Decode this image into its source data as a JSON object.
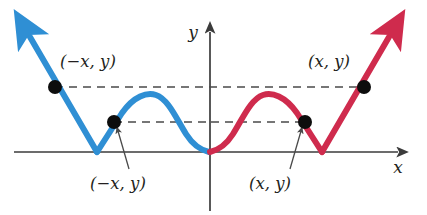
{
  "figure": {
    "background_color": "#ffffff",
    "width": 427,
    "height": 215
  },
  "axes": {
    "x_label": "x",
    "y_label": "y",
    "axis_color": "#3b3b3b",
    "origin": {
      "x": 210,
      "y": 152
    },
    "x_axis": {
      "x_start": 14,
      "x_end": 404,
      "y": 152
    },
    "y_axis": {
      "x": 210,
      "y_top": 26,
      "y_bottom": 211
    }
  },
  "curves": [
    {
      "name": "left-branch",
      "color": "#2f8fd4",
      "description": "reflected W-shaped piecewise curve left of the y-axis with arrow at upper-left"
    },
    {
      "name": "right-branch",
      "color": "#cf2b4d",
      "description": "W-shaped piecewise curve right of the y-axis with arrow at upper-right"
    }
  ],
  "points": [
    {
      "id": "upper-left",
      "label": "(−x, y)",
      "cx": 55,
      "cy": 87,
      "label_x": 62,
      "label_y": 63
    },
    {
      "id": "upper-right",
      "label": "(x, y)",
      "cx": 364,
      "cy": 87,
      "label_x": 305,
      "label_y": 63
    },
    {
      "id": "lower-left",
      "label": "(−x, y)",
      "cx": 114,
      "cy": 122,
      "label_x": 88,
      "label_y": 184
    },
    {
      "id": "lower-right",
      "label": "(x, y)",
      "cx": 305,
      "cy": 122,
      "label_x": 247,
      "label_y": 184
    }
  ],
  "dashed_lines": [
    {
      "id": "upper-dashed",
      "x1": 55,
      "x2": 364,
      "y": 87
    },
    {
      "id": "lower-dashed-left",
      "x1": 114,
      "x2": 210,
      "y": 122
    },
    {
      "id": "lower-dashed-right",
      "x1": 210,
      "x2": 305,
      "y": 122
    }
  ],
  "leader_lines": [
    {
      "id": "leader-left",
      "from_x": 128,
      "from_y": 170,
      "to_x": 118,
      "to_y": 130
    },
    {
      "id": "leader-right",
      "from_x": 291,
      "from_y": 170,
      "to_x": 301,
      "to_y": 130
    }
  ],
  "labels": {
    "upper_left": "(−x, y)",
    "upper_right": "(x, y)",
    "lower_left": "(−x, y)",
    "lower_right": "(x, y)",
    "x_axis": "x",
    "y_axis": "y"
  },
  "colors": {
    "blue": "#2f8fd4",
    "red": "#cf2b4d",
    "axis": "#3b3b3b",
    "dot": "#0d0d0d",
    "dash": "#4a4a4a",
    "text": "#231f20"
  }
}
